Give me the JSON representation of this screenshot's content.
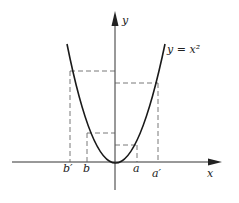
{
  "diagram": {
    "curve_label": "y = x²",
    "axis_labels": {
      "x": "x",
      "y": "y"
    },
    "tick_labels": [
      "b′",
      "b",
      "a",
      "a′"
    ],
    "colors": {
      "stroke": "#1a1a1a",
      "dashed": "#555555",
      "background": "#ffffff"
    }
  }
}
